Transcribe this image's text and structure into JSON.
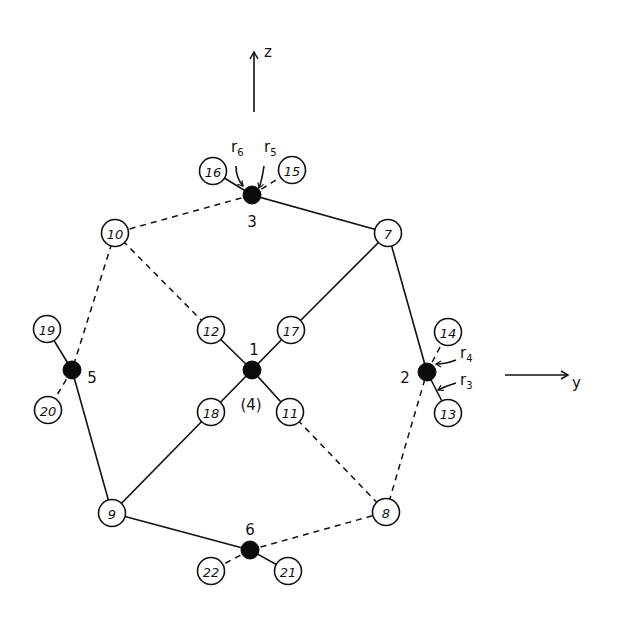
{
  "diagram": {
    "axes": {
      "z": {
        "label": "z",
        "x1": 254,
        "y1": 112,
        "x2": 254,
        "y2": 52,
        "label_x": 264,
        "label_y": 57
      },
      "y": {
        "label": "y",
        "x1": 505,
        "y1": 375,
        "x2": 568,
        "y2": 375,
        "label_x": 572,
        "label_y": 388
      }
    },
    "nodes": [
      {
        "id": "1",
        "x": 252,
        "y": 370,
        "type": "filled"
      },
      {
        "id": "2",
        "x": 427,
        "y": 372,
        "type": "filled"
      },
      {
        "id": "3",
        "x": 252,
        "y": 195,
        "type": "filled"
      },
      {
        "id": "5",
        "x": 72,
        "y": 370,
        "type": "filled"
      },
      {
        "id": "6",
        "x": 250,
        "y": 550,
        "type": "filled"
      },
      {
        "id": "7",
        "x": 388,
        "y": 233,
        "type": "open"
      },
      {
        "id": "8",
        "x": 386,
        "y": 512,
        "type": "open"
      },
      {
        "id": "9",
        "x": 112,
        "y": 513,
        "type": "open"
      },
      {
        "id": "10",
        "x": 115,
        "y": 233,
        "type": "open"
      },
      {
        "id": "11",
        "x": 290,
        "y": 412,
        "type": "open"
      },
      {
        "id": "12",
        "x": 211,
        "y": 330,
        "type": "open"
      },
      {
        "id": "13",
        "x": 448,
        "y": 413,
        "type": "open"
      },
      {
        "id": "14",
        "x": 448,
        "y": 332,
        "type": "open"
      },
      {
        "id": "15",
        "x": 292,
        "y": 170,
        "type": "open"
      },
      {
        "id": "16",
        "x": 213,
        "y": 171,
        "type": "open"
      },
      {
        "id": "17",
        "x": 291,
        "y": 330,
        "type": "open"
      },
      {
        "id": "18",
        "x": 211,
        "y": 412,
        "type": "open"
      },
      {
        "id": "19",
        "x": 47,
        "y": 329,
        "type": "open"
      },
      {
        "id": "20",
        "x": 48,
        "y": 410,
        "type": "open"
      },
      {
        "id": "21",
        "x": 288,
        "y": 571,
        "type": "open"
      },
      {
        "id": "22",
        "x": 211,
        "y": 571,
        "type": "open"
      }
    ],
    "filled_labels": [
      {
        "text": "1",
        "x": 254,
        "y": 350
      },
      {
        "text": "2",
        "x": 405,
        "y": 378
      },
      {
        "text": "3",
        "x": 252,
        "y": 222
      },
      {
        "text": "5",
        "x": 92,
        "y": 378
      },
      {
        "text": "6",
        "x": 250,
        "y": 530
      },
      {
        "text": "(4)",
        "x": 251,
        "y": 405
      }
    ],
    "edges": [
      {
        "from": "3",
        "to": "7",
        "style": "solid"
      },
      {
        "from": "3",
        "to": "10",
        "style": "dashed"
      },
      {
        "from": "3",
        "to": "16",
        "style": "solid"
      },
      {
        "from": "3",
        "to": "15",
        "style": "dashed"
      },
      {
        "from": "7",
        "to": "2",
        "style": "solid"
      },
      {
        "from": "7",
        "to": "17",
        "style": "solid"
      },
      {
        "from": "17",
        "to": "1",
        "style": "solid"
      },
      {
        "from": "12",
        "to": "1",
        "style": "solid"
      },
      {
        "from": "1",
        "to": "11",
        "style": "solid"
      },
      {
        "from": "1",
        "to": "18",
        "style": "solid"
      },
      {
        "from": "18",
        "to": "9",
        "style": "solid"
      },
      {
        "from": "10",
        "to": "12",
        "style": "dashed"
      },
      {
        "from": "10",
        "to": "5",
        "style": "dashed"
      },
      {
        "from": "19",
        "to": "5",
        "style": "solid"
      },
      {
        "from": "5",
        "to": "20",
        "style": "dashed"
      },
      {
        "from": "5",
        "to": "9",
        "style": "solid"
      },
      {
        "from": "9",
        "to": "6",
        "style": "solid"
      },
      {
        "from": "6",
        "to": "8",
        "style": "dashed"
      },
      {
        "from": "6",
        "to": "21",
        "style": "solid"
      },
      {
        "from": "6",
        "to": "22",
        "style": "dashed"
      },
      {
        "from": "11",
        "to": "8",
        "style": "dashed"
      },
      {
        "from": "8",
        "to": "2",
        "style": "dashed"
      },
      {
        "from": "2",
        "to": "14",
        "style": "dashed"
      },
      {
        "from": "2",
        "to": "13",
        "style": "solid"
      }
    ],
    "force_labels": [
      {
        "r": "r",
        "sub": "6",
        "x": 231,
        "y": 152
      },
      {
        "r": "r",
        "sub": "5",
        "x": 264,
        "y": 152
      },
      {
        "r": "r",
        "sub": "4",
        "x": 460,
        "y": 358
      },
      {
        "r": "r",
        "sub": "3",
        "x": 460,
        "y": 385
      }
    ]
  }
}
